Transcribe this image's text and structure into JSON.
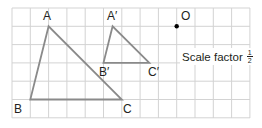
{
  "figure": {
    "type": "enlargement-diagram",
    "grid": {
      "columns": 13,
      "rows": 6,
      "cell_px": 18.3,
      "origin_px": [
        12,
        8
      ],
      "line_color": "#d0d0d0"
    },
    "triangle_original": {
      "color": "#8a8a8a",
      "vertices": [
        {
          "label": "A",
          "grid": [
            2,
            1
          ]
        },
        {
          "label": "B",
          "grid": [
            1,
            5
          ]
        },
        {
          "label": "C",
          "grid": [
            6,
            5
          ]
        }
      ]
    },
    "triangle_image": {
      "color": "#8a8a8a",
      "vertices": [
        {
          "label": "A′",
          "grid": [
            5.5,
            1
          ]
        },
        {
          "label": "B′",
          "grid": [
            5,
            3
          ]
        },
        {
          "label": "C′",
          "grid": [
            7.5,
            3
          ]
        }
      ]
    },
    "centre": {
      "label": "O",
      "grid": [
        9,
        1
      ],
      "color": "#000000"
    },
    "annotation": {
      "text": "Scale factor",
      "fraction": {
        "numerator": "1",
        "denominator": "2"
      }
    }
  },
  "labels": {
    "A": "A",
    "B": "B",
    "C": "C",
    "A_prime": "A′",
    "B_prime": "B′",
    "C_prime": "C′",
    "O": "O"
  }
}
